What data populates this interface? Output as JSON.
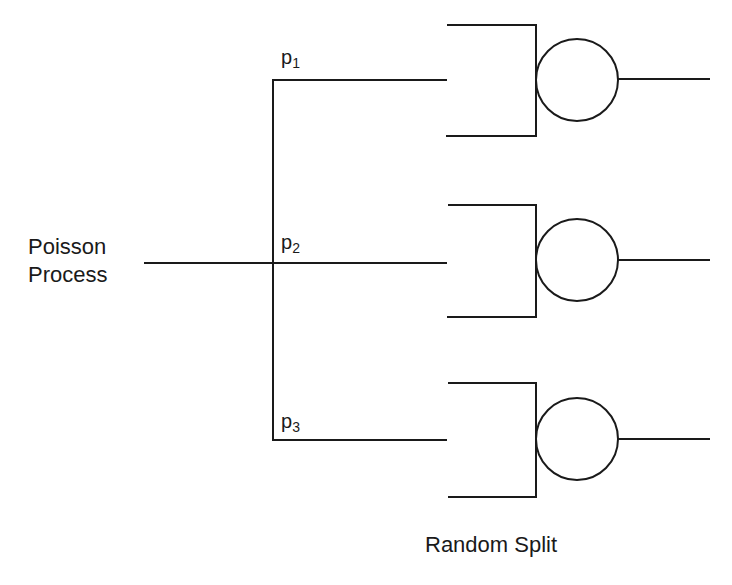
{
  "diagram": {
    "source_label_line1": "Poisson",
    "source_label_line2": "Process",
    "caption": "Random Split",
    "branches": [
      {
        "prob_symbol": "p",
        "prob_index": "1"
      },
      {
        "prob_symbol": "p",
        "prob_index": "2"
      },
      {
        "prob_symbol": "p",
        "prob_index": "3"
      }
    ],
    "colors": {
      "line": "#1a1a1a",
      "background": "#ffffff"
    }
  }
}
